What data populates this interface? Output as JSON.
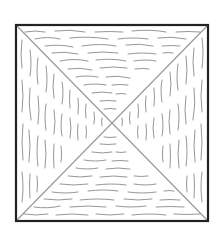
{
  "figure": {
    "square": {
      "x": 15,
      "y": 24,
      "size": 194
    },
    "colors": {
      "border": "#222222",
      "diagonal": "#9a9a9a",
      "grain": "#8a8a8a",
      "background": "#ffffff"
    },
    "triangles": [
      {
        "position": "top",
        "grain_direction": "horizontal"
      },
      {
        "position": "bottom",
        "grain_direction": "horizontal"
      },
      {
        "position": "left",
        "grain_direction": "vertical"
      },
      {
        "position": "right",
        "grain_direction": "vertical"
      }
    ]
  }
}
